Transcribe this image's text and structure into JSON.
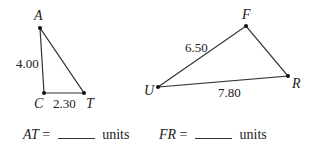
{
  "triangles": [
    {
      "name": "ACT",
      "vertices": {
        "A": {
          "label": "A",
          "x": 40,
          "y": 28
        },
        "C": {
          "label": "C",
          "x": 44,
          "y": 93
        },
        "T": {
          "label": "T",
          "x": 84,
          "y": 93
        }
      },
      "sides": {
        "AC": "4.00",
        "CT": "2.30"
      }
    },
    {
      "name": "UFR",
      "vertices": {
        "F": {
          "label": "F",
          "x": 246,
          "y": 26
        },
        "U": {
          "label": "U",
          "x": 158,
          "y": 87
        },
        "R": {
          "label": "R",
          "x": 288,
          "y": 76
        }
      },
      "sides": {
        "UF": "6.50",
        "UR": "7.80"
      }
    }
  ],
  "questions": [
    {
      "variable": "AT",
      "equals": "=",
      "unit": "units"
    },
    {
      "variable": "FR",
      "equals": "=",
      "unit": "units"
    }
  ],
  "colors": {
    "line": "#333333",
    "text": "#222222"
  }
}
